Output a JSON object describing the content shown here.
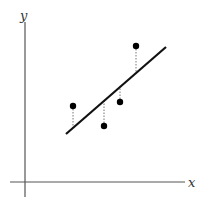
{
  "diagram": {
    "type": "linear-regression-residuals",
    "axes": {
      "x_label": "x",
      "y_label": "y"
    },
    "regression_line": {
      "x1": 66,
      "y1": 134,
      "x2": 166,
      "y2": 47
    },
    "points": [
      {
        "cx": 73,
        "cy": 106,
        "line_y": 128
      },
      {
        "cx": 104,
        "cy": 126,
        "line_y": 101
      },
      {
        "cx": 120,
        "cy": 102,
        "line_y": 88
      },
      {
        "cx": 136,
        "cy": 46,
        "line_y": 73
      }
    ],
    "colors": {
      "axis": "#555555",
      "line": "#111111",
      "point": "#000000",
      "residual": "#777777"
    }
  }
}
